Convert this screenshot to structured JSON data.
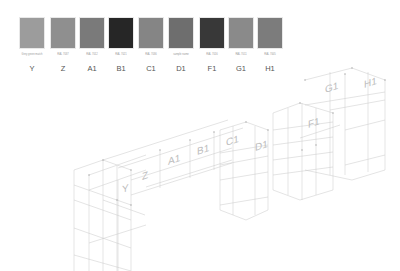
{
  "legend": {
    "swatches": [
      {
        "label": "Y",
        "code": "Grey green match",
        "color": "#9c9c9c",
        "x": 19
      },
      {
        "label": "Z",
        "code": "RAL 7037",
        "color": "#8f8f8f",
        "x": 50
      },
      {
        "label": "A1",
        "code": "RAL 7012",
        "color": "#7a7a7a",
        "x": 79
      },
      {
        "label": "B1",
        "code": "RAL 7021",
        "color": "#262626",
        "x": 108
      },
      {
        "label": "C1",
        "code": "RAL 7036",
        "color": "#858585",
        "x": 138
      },
      {
        "label": "D1",
        "code": "sample name",
        "color": "#6e6e6e",
        "x": 168
      },
      {
        "label": "F1",
        "code": "RAL 7016",
        "color": "#383838",
        "x": 199
      },
      {
        "label": "G1",
        "code": "RAL 7011",
        "color": "#8a8a8a",
        "x": 228
      },
      {
        "label": "H1",
        "code": "RAL 7005",
        "color": "#7c7c7c",
        "x": 257
      }
    ]
  },
  "drawing": {
    "unit_labels": [
      {
        "text": "Y",
        "x": 122,
        "y": 193
      },
      {
        "text": "Z",
        "x": 142,
        "y": 180
      },
      {
        "text": "A1",
        "x": 168,
        "y": 165
      },
      {
        "text": "B1",
        "x": 197,
        "y": 155
      },
      {
        "text": "C1",
        "x": 226,
        "y": 146
      },
      {
        "text": "D1",
        "x": 255,
        "y": 151
      },
      {
        "text": "F1",
        "x": 308,
        "y": 128
      },
      {
        "text": "G1",
        "x": 325,
        "y": 93
      },
      {
        "text": "H1",
        "x": 364,
        "y": 88
      }
    ]
  }
}
